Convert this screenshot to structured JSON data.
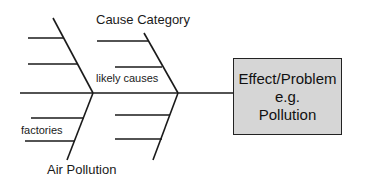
{
  "diagram": {
    "type": "fishbone",
    "labels": {
      "top_category": "Cause Category",
      "likely_causes": "likely causes",
      "bottom_cause": "factories",
      "bottom_category": "Air Pollution"
    },
    "effect_box": {
      "line1": "Effect/Problem",
      "line2": "e.g.",
      "line3": "Pollution",
      "fill": "#d6d6d6"
    },
    "colors": {
      "line": "#1a1a1a",
      "background": "#ffffff"
    }
  }
}
